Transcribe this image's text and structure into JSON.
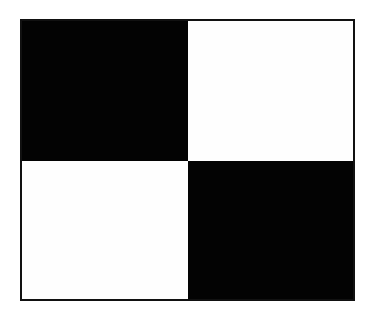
{
  "diagram": {
    "type": "checkerboard-2x2",
    "rows": 2,
    "cols": 2,
    "border_color": "#111111",
    "cells": [
      {
        "row": 0,
        "col": 0,
        "fill": "black",
        "color": "#030303"
      },
      {
        "row": 0,
        "col": 1,
        "fill": "white",
        "color": "#fefefe"
      },
      {
        "row": 1,
        "col": 0,
        "fill": "white",
        "color": "#fefefe"
      },
      {
        "row": 1,
        "col": 1,
        "fill": "black",
        "color": "#030303"
      }
    ]
  }
}
